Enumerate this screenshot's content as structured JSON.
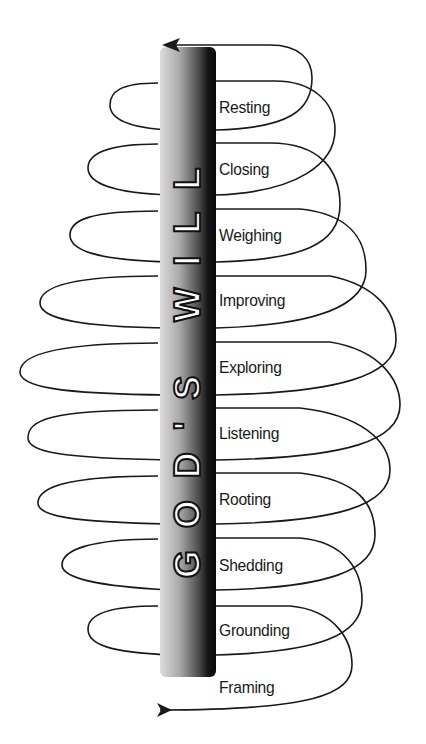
{
  "diagram": {
    "pole_title": "GOD'S WILL",
    "stages": [
      {
        "label": "Resting"
      },
      {
        "label": "Closing"
      },
      {
        "label": "Weighing"
      },
      {
        "label": "Improving"
      },
      {
        "label": "Exploring"
      },
      {
        "label": "Listening"
      },
      {
        "label": "Rooting"
      },
      {
        "label": "Shedding"
      },
      {
        "label": "Grounding"
      },
      {
        "label": "Framing"
      }
    ],
    "arrows": {
      "start": "bottom-left (entering spiral)",
      "end": "top-left (exiting spiral)"
    },
    "colors": {
      "line": "#1a1a1a",
      "pole_light": "#d8d8d8",
      "pole_dark": "#0a0a0a",
      "text": "#1a1a1a"
    }
  }
}
